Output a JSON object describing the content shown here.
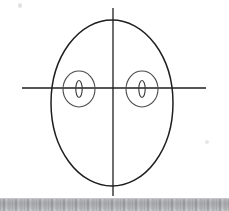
{
  "page": {
    "background_color": "#ffffff",
    "width": 229,
    "height": 211
  },
  "figure": {
    "ink_color": "#1a1a1a",
    "stroke_width": 1.2
  },
  "chart_data": {
    "type": "scatter",
    "title": "",
    "subtitle": "",
    "xlabel": "",
    "ylabel": "",
    "grid": false,
    "legend": "none",
    "xlim": [
      0,
      229
    ],
    "ylim": [
      0,
      211
    ],
    "axes": {
      "horizontal_axis": {
        "name": "horizontal-axis-line",
        "y": 88,
        "x_start": 22,
        "x_end": 206,
        "color": "#1f1f1f",
        "width": 1.3
      },
      "vertical_axis": {
        "name": "vertical-axis-line",
        "x": 113,
        "y_start": 8,
        "y_end": 196,
        "color": "#1f1f1f",
        "width": 1.3
      }
    },
    "shapes": [
      {
        "name": "outer-ellipse",
        "role": "head-outline",
        "kind": "ellipse",
        "cx": 112,
        "cy": 103,
        "rx": 61,
        "ry": 83,
        "fill": "none",
        "stroke": "#1f1f1f",
        "stroke_width": 1.5
      },
      {
        "name": "left-eye-outer-ellipse",
        "role": "left-eye-iris",
        "kind": "ellipse",
        "cx": 79,
        "cy": 89,
        "rx": 16,
        "ry": 18,
        "fill": "none",
        "stroke": "#4a4a4a",
        "stroke_width": 1.1
      },
      {
        "name": "left-eye-pupil-ellipse",
        "role": "left-eye-pupil",
        "kind": "ellipse",
        "cx": 79,
        "cy": 89,
        "rx": 3.2,
        "ry": 8.5,
        "fill": "none",
        "stroke": "#3a3a3a",
        "stroke_width": 1.1
      },
      {
        "name": "right-eye-outer-ellipse",
        "role": "right-eye-iris",
        "kind": "ellipse",
        "cx": 142,
        "cy": 89,
        "rx": 16,
        "ry": 18,
        "fill": "none",
        "stroke": "#4a4a4a",
        "stroke_width": 1.1
      },
      {
        "name": "right-eye-pupil-ellipse",
        "role": "right-eye-pupil",
        "kind": "ellipse",
        "cx": 142,
        "cy": 89,
        "rx": 3.2,
        "ry": 8.5,
        "fill": "none",
        "stroke": "#3a3a3a",
        "stroke_width": 1.1
      }
    ],
    "annotations": []
  },
  "artifacts": {
    "bottom_band": {
      "label": "scanner edge band",
      "top_y": 199,
      "height": 12,
      "base_color": "#a9abae"
    },
    "specks": [
      {
        "label": "top-left speck",
        "x": 18,
        "y": 3
      },
      {
        "label": "mid-right speck",
        "x": 205,
        "y": 140
      }
    ]
  }
}
